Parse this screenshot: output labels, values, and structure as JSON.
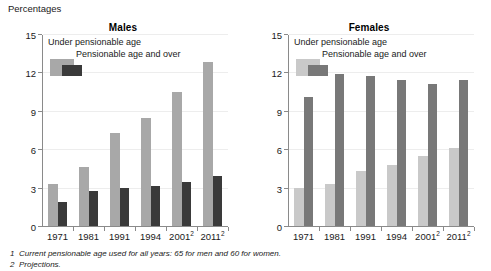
{
  "units_label": "Percentages",
  "colors": {
    "males_under": "#a8a8a8",
    "males_over": "#3a3a3a",
    "females_under": "#c9c9c9",
    "females_over": "#787878",
    "axis": "#8a8a8a",
    "grid": "#ededed"
  },
  "legend": {
    "under_label": "Under pensionable age",
    "over_label": "Pensionable age and over"
  },
  "footnotes": [
    {
      "num": "1",
      "text": "Current pensionable age used for all years: 65 for men and 60 for women."
    },
    {
      "num": "2",
      "text": "Projections."
    }
  ],
  "chart_data": [
    {
      "type": "bar",
      "title": "Males",
      "xlabel": "",
      "ylabel": "Percentages",
      "ylim": [
        0,
        15
      ],
      "yticks": [
        0,
        3,
        6,
        9,
        12,
        15
      ],
      "grid": true,
      "legend_position": "top-left",
      "categories": [
        "1971",
        "1981",
        "1991",
        "1994",
        "2001",
        "2011"
      ],
      "category_footnotes": [
        "",
        "",
        "",
        "",
        "2",
        "2"
      ],
      "series": [
        {
          "name": "Under pensionable age",
          "values": [
            3.3,
            4.6,
            7.3,
            8.4,
            10.5,
            12.8
          ]
        },
        {
          "name": "Pensionable age and over",
          "values": [
            1.9,
            2.7,
            3.0,
            3.1,
            3.4,
            3.9
          ]
        }
      ]
    },
    {
      "type": "bar",
      "title": "Females",
      "xlabel": "",
      "ylabel": "Percentages",
      "ylim": [
        0,
        15
      ],
      "yticks": [
        0,
        3,
        6,
        9,
        12,
        15
      ],
      "grid": true,
      "legend_position": "top-left",
      "categories": [
        "1971",
        "1981",
        "1991",
        "1994",
        "2001",
        "2011"
      ],
      "category_footnotes": [
        "",
        "",
        "",
        "",
        "2",
        "2"
      ],
      "series": [
        {
          "name": "Under pensionable age",
          "values": [
            3.0,
            3.3,
            4.3,
            4.8,
            5.5,
            6.1
          ]
        },
        {
          "name": "Pensionable age and over",
          "values": [
            10.1,
            11.9,
            11.7,
            11.4,
            11.1,
            11.4
          ]
        }
      ]
    }
  ]
}
